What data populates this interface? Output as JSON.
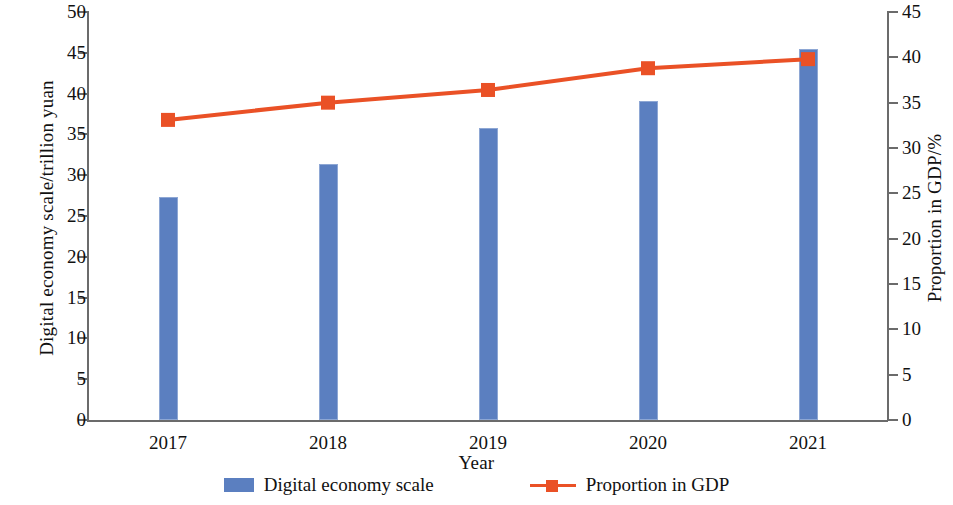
{
  "chart_data": {
    "type": "bar",
    "title": "",
    "subtitle": "",
    "xlabel": "Year",
    "ylabel": "Digital economy scale/trillion yuan",
    "y2label": "Proportion in GDP/%",
    "categories": [
      "2017",
      "2018",
      "2019",
      "2020",
      "2021"
    ],
    "grid": false,
    "legend_position": "bottom",
    "ylim": [
      0,
      50
    ],
    "y2lim": [
      0,
      45
    ],
    "y_ticks": [
      "0",
      "5",
      "10",
      "15",
      "20",
      "25",
      "30",
      "35",
      "40",
      "45",
      "50"
    ],
    "y2_ticks": [
      "0",
      "5",
      "10",
      "15",
      "20",
      "25",
      "30",
      "35",
      "40",
      "45"
    ],
    "series": [
      {
        "name": "Digital economy scale",
        "type": "bar",
        "axis": "left",
        "color": "#5b7fc0",
        "values": [
          27.3,
          31.4,
          35.8,
          39.1,
          45.5
        ]
      },
      {
        "name": "Proportion in GDP",
        "type": "line",
        "axis": "right",
        "color": "#ea5126",
        "marker": "square",
        "values": [
          33.1,
          35.0,
          36.4,
          38.8,
          39.8
        ]
      }
    ]
  },
  "legend": {
    "items": [
      {
        "label": "Digital economy scale",
        "swatch": "bar-swatch-icon"
      },
      {
        "label": "Proportion in GDP",
        "swatch": "line-marker-icon"
      }
    ]
  },
  "axes": {
    "left_title": "Digital economy scale/trillion yuan",
    "right_title": "Proportion in GDP/%",
    "bottom_title": "Year"
  }
}
